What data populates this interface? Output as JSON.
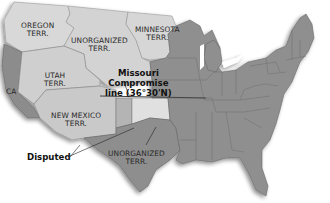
{
  "map": {
    "title": "",
    "colors": {
      "territory_light": "#d6d6d6",
      "territory_mid": "#c4c4c4",
      "state_dark": "#8e8e8e",
      "state_border": "#6a6a6a",
      "ca": "#8a8a8a",
      "indian_light": "#e2e2e2",
      "disputed": "#b8b8b8",
      "background": "#ffffff"
    },
    "regions": [
      {
        "id": "oregon",
        "lines": [
          "OREGON",
          "TERR."
        ]
      },
      {
        "id": "unorganized_north",
        "lines": [
          "UNORGANIZED",
          "TERR."
        ]
      },
      {
        "id": "minnesota",
        "lines": [
          "MINNESOTA",
          "TERR."
        ]
      },
      {
        "id": "utah",
        "lines": [
          "UTAH",
          "TERR."
        ]
      },
      {
        "id": "california",
        "lines": [
          "CA"
        ]
      },
      {
        "id": "new_mexico",
        "lines": [
          "NEW MEXICO",
          "TERR."
        ]
      },
      {
        "id": "unorganized_south",
        "lines": [
          "UNORGANIZED",
          "TERR."
        ]
      }
    ],
    "callouts": {
      "missouri": {
        "lines": [
          "Missouri",
          "Compromise",
          "line (36°30'N)"
        ]
      },
      "disputed": {
        "label": "Disputed"
      }
    }
  }
}
